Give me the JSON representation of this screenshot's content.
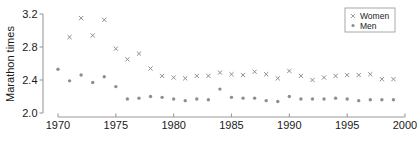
{
  "chart_data": {
    "type": "scatter",
    "title": "",
    "xlabel": "",
    "ylabel": "Marathon times",
    "xlim": [
      1970,
      2000
    ],
    "ylim": [
      2.0,
      3.2
    ],
    "xticks": [
      1970,
      1975,
      1980,
      1985,
      1990,
      1995,
      2000
    ],
    "xtick_labels": [
      "1970",
      "1975",
      "1980",
      "1985",
      "1990",
      "1995",
      "2000"
    ],
    "yticks": [
      2.0,
      2.4,
      2.8,
      3.2
    ],
    "ytick_labels": [
      "2.0",
      "2.4",
      "2.8",
      "3.2"
    ],
    "grid": false,
    "legend_position": "top-right",
    "x": [
      1970,
      1971,
      1972,
      1973,
      1974,
      1975,
      1976,
      1977,
      1978,
      1979,
      1980,
      1981,
      1982,
      1983,
      1984,
      1985,
      1986,
      1987,
      1988,
      1989,
      1990,
      1991,
      1992,
      1993,
      1994,
      1995,
      1996,
      1997,
      1998,
      1999
    ],
    "series": [
      {
        "name": "Women",
        "marker": "x",
        "color": "#8e8e8e",
        "values": [
          null,
          2.92,
          3.15,
          2.94,
          3.13,
          2.78,
          2.65,
          2.72,
          2.54,
          2.45,
          2.43,
          2.42,
          2.45,
          2.45,
          2.49,
          2.47,
          2.46,
          2.5,
          2.47,
          2.42,
          2.51,
          2.45,
          2.4,
          2.43,
          2.45,
          2.46,
          2.46,
          2.47,
          2.41,
          2.41
        ]
      },
      {
        "name": "Men",
        "marker": "circle",
        "color": "#8e8e8e",
        "values": [
          2.53,
          2.39,
          2.46,
          2.37,
          2.44,
          2.32,
          2.17,
          2.18,
          2.2,
          2.19,
          2.17,
          2.15,
          2.17,
          2.16,
          2.29,
          2.19,
          2.18,
          2.18,
          2.15,
          2.14,
          2.2,
          2.17,
          2.17,
          2.17,
          2.18,
          2.17,
          2.15,
          2.16,
          2.16,
          2.16
        ]
      }
    ],
    "legend": [
      {
        "label": "Women",
        "marker": "x"
      },
      {
        "label": "Men",
        "marker": "circle"
      }
    ]
  }
}
